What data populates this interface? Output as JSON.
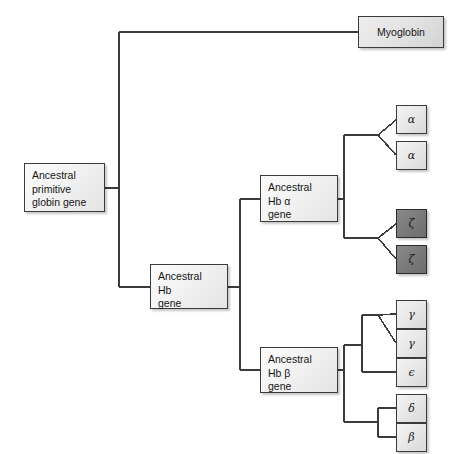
{
  "diagram": {
    "type": "phylogenetic-tree",
    "background_color": "#ffffff",
    "line_color": "#3b3b3b",
    "colors": {
      "box_light": "#eeeeee",
      "box_dark": "#7c7c7c",
      "border": "#3b3b3b"
    }
  },
  "nodes": {
    "root": {
      "id": "ancestral-primitive-globin-gene",
      "label": "Ancestral\nprimitive\nglobin gene",
      "shade": "light",
      "x": 24,
      "y": 163,
      "w": 81,
      "h": 49
    },
    "myoglobin": {
      "id": "myoglobin",
      "label": "Myoglobin",
      "shade": "light",
      "x": 358,
      "y": 16,
      "w": 86,
      "h": 32
    },
    "hb": {
      "id": "ancestral-hb-gene",
      "label": "Ancestral\nHb\ngene",
      "shade": "light",
      "x": 150,
      "y": 264,
      "w": 78,
      "h": 45
    },
    "hb_alpha": {
      "id": "ancestral-hb-alpha-gene",
      "label": "Ancestral\nHb α\ngene",
      "shade": "light",
      "x": 260,
      "y": 175,
      "w": 78,
      "h": 47
    },
    "hb_beta": {
      "id": "ancestral-hb-beta-gene",
      "label": "Ancestral\nHb β\ngene",
      "shade": "light",
      "x": 260,
      "y": 347,
      "w": 78,
      "h": 46
    }
  },
  "leaves": [
    {
      "id": "alpha-1",
      "label": "α",
      "shade": "light",
      "x": 396,
      "y": 105,
      "w": 31,
      "h": 29
    },
    {
      "id": "alpha-2",
      "label": "α",
      "shade": "light",
      "x": 396,
      "y": 141,
      "w": 31,
      "h": 29
    },
    {
      "id": "zeta-1",
      "label": "ζ",
      "shade": "dark",
      "x": 396,
      "y": 209,
      "w": 31,
      "h": 29
    },
    {
      "id": "zeta-2",
      "label": "ζ",
      "shade": "dark",
      "x": 396,
      "y": 245,
      "w": 31,
      "h": 29
    },
    {
      "id": "gamma-1",
      "label": "γ",
      "shade": "light",
      "x": 396,
      "y": 300,
      "w": 31,
      "h": 29
    },
    {
      "id": "gamma-2",
      "label": "γ",
      "shade": "light",
      "x": 396,
      "y": 329,
      "w": 31,
      "h": 29
    },
    {
      "id": "epsilon",
      "label": "ϵ",
      "shade": "light",
      "x": 396,
      "y": 358,
      "w": 31,
      "h": 29
    },
    {
      "id": "delta",
      "label": "δ",
      "shade": "light",
      "x": 396,
      "y": 394,
      "w": 31,
      "h": 29
    },
    {
      "id": "beta",
      "label": "β",
      "shade": "light",
      "x": 396,
      "y": 423,
      "w": 31,
      "h": 29
    }
  ],
  "edges": [
    {
      "from": "ancestral-primitive-globin-gene",
      "to": "trunk-1"
    },
    {
      "from": "trunk-1",
      "to": "myoglobin"
    },
    {
      "from": "trunk-1",
      "to": "ancestral-hb-gene"
    },
    {
      "from": "ancestral-hb-gene",
      "to": "trunk-2"
    },
    {
      "from": "trunk-2",
      "to": "ancestral-hb-alpha-gene"
    },
    {
      "from": "trunk-2",
      "to": "ancestral-hb-beta-gene"
    },
    {
      "from": "ancestral-hb-alpha-gene",
      "to": "alpha-1"
    },
    {
      "from": "ancestral-hb-alpha-gene",
      "to": "alpha-2"
    },
    {
      "from": "ancestral-hb-alpha-gene",
      "to": "zeta-1"
    },
    {
      "from": "ancestral-hb-alpha-gene",
      "to": "zeta-2"
    },
    {
      "from": "ancestral-hb-beta-gene",
      "to": "gamma-1"
    },
    {
      "from": "ancestral-hb-beta-gene",
      "to": "gamma-2"
    },
    {
      "from": "ancestral-hb-beta-gene",
      "to": "epsilon"
    },
    {
      "from": "ancestral-hb-beta-gene",
      "to": "delta"
    },
    {
      "from": "ancestral-hb-beta-gene",
      "to": "beta"
    }
  ]
}
